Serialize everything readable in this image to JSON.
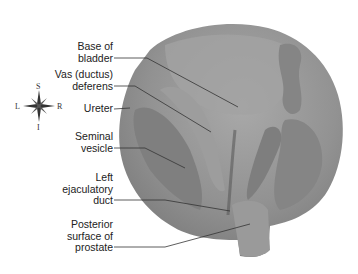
{
  "figure": {
    "labels": [
      {
        "id": "base-of-bladder",
        "text": "Base of\nbladder",
        "top": 40,
        "line": "M114,58 L147,58 L238,107"
      },
      {
        "id": "vas-deferens",
        "text": "Vas (ductus)\ndeferens",
        "top": 68,
        "line": "M114,86 L135,86 L211,132"
      },
      {
        "id": "ureter",
        "text": "Ureter",
        "top": 103,
        "line": "M114,109 L130,108"
      },
      {
        "id": "seminal-vesicle",
        "text": "Seminal\nvesicle",
        "top": 131,
        "line": "M114,148 L145,148 L185,168"
      },
      {
        "id": "left-ejaculatory-duct",
        "text": "Left\nejaculatory\nduct",
        "top": 171,
        "line": "M114,200 L165,200 L230,211"
      },
      {
        "id": "posterior-surface-of-prostate",
        "text": "Posterior\nsurface of\nprostate",
        "top": 221,
        "line": "M114,247 L165,247 L250,224"
      }
    ],
    "compass": {
      "top": "S",
      "bottom": "I",
      "left": "L",
      "right": "R"
    },
    "colors": {
      "tissue_base": "#8c8c8c",
      "tissue_light": "#a8a8a8",
      "tissue_dark": "#6a6a6a",
      "leader_line": "#333333",
      "text": "#222222"
    }
  }
}
